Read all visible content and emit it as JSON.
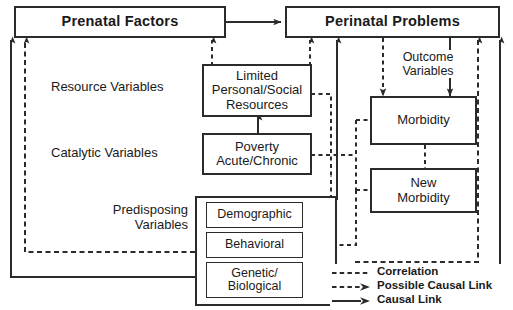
{
  "diagram": {
    "title_boxes": [
      {
        "id": "prenatal",
        "label": "Prenatal Factors"
      },
      {
        "id": "perinatal",
        "label": "Perinatal Problems"
      }
    ],
    "row_labels": [
      {
        "id": "resource",
        "label": "Resource Variables"
      },
      {
        "id": "catalytic",
        "label": "Catalytic Variables"
      },
      {
        "id": "predisposing",
        "line1": "Predisposing",
        "line2": "Variables"
      }
    ],
    "center_boxes": [
      {
        "id": "limited-resources",
        "line1": "Limited",
        "line2": "Personal/Social",
        "line3": "Resources"
      },
      {
        "id": "poverty",
        "line1": "Poverty",
        "line2": "Acute/Chronic"
      }
    ],
    "predisposing_boxes": [
      {
        "id": "demographic",
        "line1": "Demographic"
      },
      {
        "id": "behavioral",
        "line1": "Behavioral"
      },
      {
        "id": "genetic-biological",
        "line1": "Genetic/",
        "line2": "Biological"
      }
    ],
    "outcome_boxes": [
      {
        "id": "morbidity",
        "line1": "Morbidity"
      },
      {
        "id": "new-morbidity",
        "line1": "New",
        "line2": "Morbidity"
      }
    ],
    "annotations": [
      {
        "id": "outcome-variables",
        "line1": "Outcome",
        "line2": "Variables"
      }
    ],
    "legend": {
      "items": [
        {
          "id": "correlation",
          "label": "Correlation",
          "style": "dashed",
          "arrow": false
        },
        {
          "id": "possible-causal-link",
          "label": "Possible Causal Link",
          "style": "dashed",
          "arrow": true
        },
        {
          "id": "causal-link",
          "label": "Causal Link",
          "style": "solid",
          "arrow": true
        }
      ]
    },
    "colors": {
      "stroke": "#2b2b2b",
      "text": "#1a1a1a",
      "background": "#ffffff"
    }
  }
}
